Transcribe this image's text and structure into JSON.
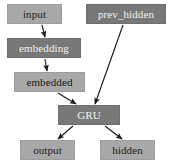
{
  "diagram": {
    "type": "flowchart",
    "background_color": "#ffffff",
    "palette": {
      "light_node_fill": "#a8a8a8",
      "light_node_text": "#1a1a1a",
      "dark_node_fill": "#787878",
      "dark_node_text": "#f2f2f2",
      "node_border": "#8f8f8f",
      "edge_color": "#1a1a1a"
    },
    "nodes": [
      {
        "id": "input",
        "label": "input",
        "style": "light",
        "x": 7,
        "y": 4,
        "w": 55,
        "h": 20,
        "font_size": 11
      },
      {
        "id": "prev_hidden",
        "label": "prev_hidden",
        "style": "dark",
        "x": 86,
        "y": 4,
        "w": 80,
        "h": 20,
        "font_size": 11
      },
      {
        "id": "embedding",
        "label": "embedding",
        "style": "dark",
        "x": 7,
        "y": 38,
        "w": 74,
        "h": 20,
        "font_size": 11
      },
      {
        "id": "embedded",
        "label": "embedded",
        "style": "light",
        "x": 14,
        "y": 72,
        "w": 71,
        "h": 20,
        "font_size": 11
      },
      {
        "id": "gru",
        "label": "GRU",
        "style": "dark",
        "x": 58,
        "y": 105,
        "w": 62,
        "h": 20,
        "font_size": 11
      },
      {
        "id": "output",
        "label": "output",
        "style": "light",
        "x": 20,
        "y": 140,
        "w": 55,
        "h": 20,
        "font_size": 11
      },
      {
        "id": "hidden",
        "label": "hidden",
        "style": "light",
        "x": 100,
        "y": 140,
        "w": 55,
        "h": 20,
        "font_size": 11
      }
    ],
    "edges": [
      {
        "id": "edge-input-embedding",
        "from": "input",
        "to": "embedding",
        "x1": 42,
        "y1": 25,
        "x2": 45,
        "y2": 37
      },
      {
        "id": "edge-embedding-embedded",
        "from": "embedding",
        "to": "embedded",
        "x1": 45,
        "y1": 59,
        "x2": 47,
        "y2": 71
      },
      {
        "id": "edge-embedded-gru",
        "from": "embedded",
        "to": "gru",
        "x1": 58,
        "y1": 93,
        "x2": 76,
        "y2": 104
      },
      {
        "id": "edge-prevhidden-gru",
        "from": "prev_hidden",
        "to": "gru",
        "x1": 123,
        "y1": 25,
        "x2": 95,
        "y2": 104
      },
      {
        "id": "edge-gru-output",
        "from": "gru",
        "to": "output",
        "x1": 73,
        "y1": 126,
        "x2": 58,
        "y2": 139
      },
      {
        "id": "edge-gru-hidden",
        "from": "gru",
        "to": "hidden",
        "x1": 105,
        "y1": 126,
        "x2": 122,
        "y2": 139
      }
    ]
  }
}
